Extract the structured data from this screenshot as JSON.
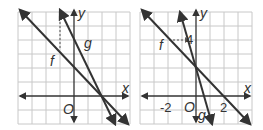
{
  "graphs": [
    {
      "id": "left",
      "x_axis_label": "x",
      "y_axis_label": "y",
      "origin_label": "O",
      "line_f_label": "f",
      "line_g_label": "g",
      "tick_labels": []
    },
    {
      "id": "right",
      "x_axis_label": "x",
      "y_axis_label": "y",
      "origin_label": "O",
      "line_f_label": "f",
      "line_g_label": "g",
      "tick_labels": [
        "-2",
        "2",
        "4"
      ]
    }
  ],
  "colors": {
    "grid": "#c8c8c8",
    "line": "#333333",
    "background": "#ffffff"
  }
}
